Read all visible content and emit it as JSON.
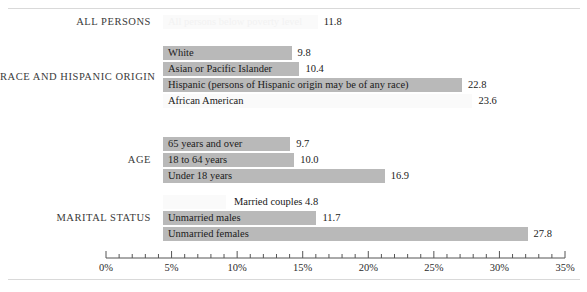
{
  "chart_data": {
    "type": "bar",
    "orientation": "horizontal",
    "title": "",
    "xlabel": "",
    "ylabel": "",
    "xlim": [
      0,
      35
    ],
    "xunit": "%",
    "grid": false,
    "legend": "none",
    "axis": {
      "tick_labels": [
        "0%",
        "5%",
        "10%",
        "15%",
        "20%",
        "25%",
        "30%",
        "35%"
      ],
      "tick_values": [
        0,
        5,
        10,
        15,
        20,
        25,
        30,
        35
      ],
      "minor_tick_step": 1
    },
    "groups": [
      {
        "name": "ALL PERSONS",
        "bars": [
          {
            "label": "All persons below poverty level",
            "value": 11.8,
            "value_text": "11.8",
            "style": "pale",
            "label_position": "inside"
          }
        ]
      },
      {
        "name": "RACE AND HISPANIC ORIGIN",
        "bars": [
          {
            "label": "White",
            "value": 9.8,
            "value_text": "9.8",
            "style": "shaded",
            "label_position": "inside"
          },
          {
            "label": "Asian or Pacific Islander",
            "value": 10.4,
            "value_text": "10.4",
            "style": "shaded",
            "label_position": "inside"
          },
          {
            "label": "Hispanic (persons of Hispanic origin may be of any race)",
            "value": 22.8,
            "value_text": "22.8",
            "style": "shaded",
            "label_position": "inside"
          },
          {
            "label": "African American",
            "value": 23.6,
            "value_text": "23.6",
            "style": "pale",
            "label_position": "inside"
          }
        ]
      },
      {
        "name": "AGE",
        "bars": [
          {
            "label": "65 years and over",
            "value": 9.7,
            "value_text": "9.7",
            "style": "shaded",
            "label_position": "inside"
          },
          {
            "label": "18 to 64 years",
            "value": 10.0,
            "value_text": "10.0",
            "style": "shaded",
            "label_position": "inside"
          },
          {
            "label": "Under 18 years",
            "value": 16.9,
            "value_text": "16.9",
            "style": "shaded",
            "label_position": "inside"
          }
        ]
      },
      {
        "name": "MARITAL STATUS",
        "bars": [
          {
            "label": "Married couples",
            "value": 4.8,
            "value_text": "4.8",
            "style": "pale",
            "label_position": "outside",
            "outside_text": "Married couples 4.8"
          },
          {
            "label": "Unmarried males",
            "value": 11.7,
            "value_text": "11.7",
            "style": "shaded",
            "label_position": "inside"
          },
          {
            "label": "Unmarried females",
            "value": 27.8,
            "value_text": "27.8",
            "style": "shaded",
            "label_position": "inside"
          }
        ]
      }
    ],
    "colors": {
      "bar_shaded": "#b9b9b9",
      "bar_pale": "#fafafa",
      "axis": "#555555",
      "text": "#202020",
      "rule": "#d9d9d9"
    }
  }
}
